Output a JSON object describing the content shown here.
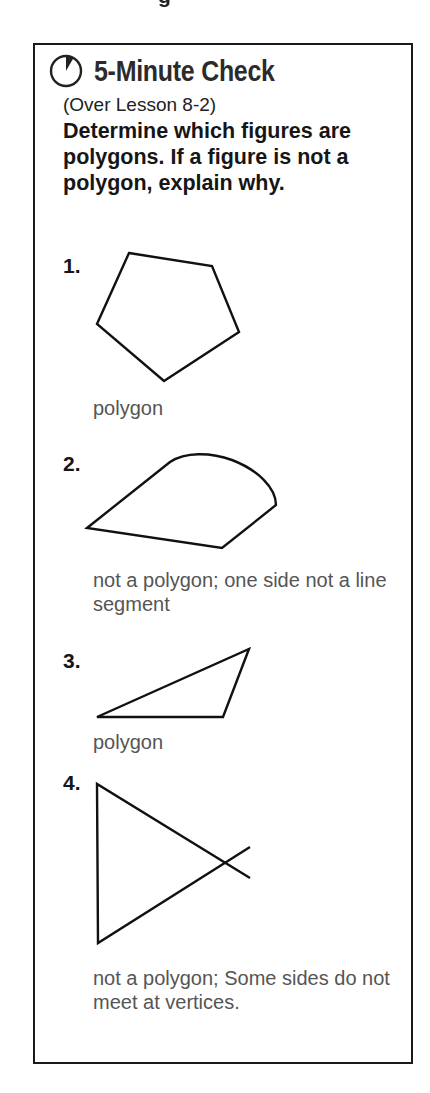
{
  "page_fragment": "g",
  "card": {
    "icon": "clock-icon",
    "title": "5-Minute Check",
    "subtitle": "(Over Lesson 8-2)",
    "question": "Determine which figures are polygons. If a figure is not a polygon, explain why.",
    "items": [
      {
        "number": "1.",
        "figure": "pentagon",
        "answer": "polygon"
      },
      {
        "number": "2.",
        "figure": "shape-with-curved-side",
        "answer": "not a polygon; one side not a line segment"
      },
      {
        "number": "3.",
        "figure": "triangle",
        "answer": "polygon"
      },
      {
        "number": "4.",
        "figure": "crossing-segments",
        "answer": "not a polygon; Some sides do not meet at vertices."
      }
    ]
  }
}
